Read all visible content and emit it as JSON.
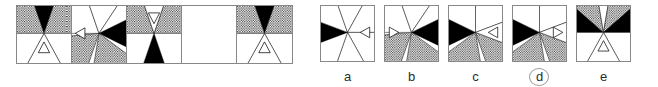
{
  "puzzle": {
    "type": "visual-analogy-matrix",
    "matrix": {
      "name": "matrix-panel",
      "cells": [
        {
          "index": 1,
          "empty": false,
          "description": "radial wedge figure: black wedge at top, dotted wedges upper-left and upper-right, white lower half with small upward triangle outline",
          "wedges": [
            {
              "start": -110,
              "end": -70,
              "fill": "black"
            },
            {
              "start": -180,
              "end": -110,
              "fill": "dotted"
            },
            {
              "start": -70,
              "end": 0,
              "fill": "dotted"
            },
            {
              "start": 0,
              "end": 60,
              "fill": "white"
            },
            {
              "start": 60,
              "end": 120,
              "fill": "white"
            },
            {
              "start": 120,
              "end": 180,
              "fill": "white"
            }
          ],
          "marker": {
            "shape": "triangle-outline",
            "direction": "up",
            "cx": 50,
            "cy": 74
          }
        },
        {
          "index": 2,
          "empty": false,
          "description": "radial wedge figure: black wedge at right, dotted wedges at lower-left and lower-right, small triangle outline pointing left at the left",
          "wedges": [
            {
              "start": -25,
              "end": 25,
              "fill": "black"
            },
            {
              "start": 35,
              "end": 100,
              "fill": "dotted"
            },
            {
              "start": 110,
              "end": 175,
              "fill": "dotted"
            },
            {
              "start": -180,
              "end": -110,
              "fill": "white"
            },
            {
              "start": -110,
              "end": -55,
              "fill": "white"
            },
            {
              "start": -55,
              "end": -25,
              "fill": "white"
            }
          ],
          "marker": {
            "shape": "triangle-outline",
            "direction": "left",
            "cx": 16,
            "cy": 48
          }
        },
        {
          "index": 3,
          "empty": false,
          "description": "radial wedge figure: black wedge at bottom, dotted wedges upper-left and upper-right, small triangle outline pointing down at the top",
          "wedges": [
            {
              "start": 70,
              "end": 110,
              "fill": "black"
            },
            {
              "start": -180,
              "end": -110,
              "fill": "dotted"
            },
            {
              "start": -70,
              "end": 0,
              "fill": "dotted"
            },
            {
              "start": -110,
              "end": -70,
              "fill": "white"
            },
            {
              "start": 0,
              "end": 70,
              "fill": "white"
            },
            {
              "start": 110,
              "end": 180,
              "fill": "white"
            }
          ],
          "marker": {
            "shape": "triangle-outline",
            "direction": "down",
            "cx": 50,
            "cy": 20
          }
        },
        {
          "index": 4,
          "empty": true,
          "description": "blank answer cell",
          "wedges": [],
          "marker": null
        },
        {
          "index": 5,
          "empty": false,
          "description": "radial wedge figure: black wedge at top, dotted wedges upper-left and upper-right, white lower half with small upward triangle outline",
          "wedges": [
            {
              "start": -110,
              "end": -70,
              "fill": "black"
            },
            {
              "start": -180,
              "end": -110,
              "fill": "dotted"
            },
            {
              "start": -70,
              "end": 0,
              "fill": "dotted"
            },
            {
              "start": 0,
              "end": 60,
              "fill": "white"
            },
            {
              "start": 60,
              "end": 120,
              "fill": "white"
            },
            {
              "start": 120,
              "end": 180,
              "fill": "white"
            }
          ],
          "marker": {
            "shape": "triangle-outline",
            "direction": "up",
            "cx": 50,
            "cy": 74
          }
        }
      ]
    },
    "options": [
      {
        "label": "a",
        "selected": false,
        "description": "black wedge at left, all other wedges white, small triangle outline pointing left at the right",
        "wedges": [
          {
            "start": 160,
            "end": -160,
            "fill": "black"
          },
          {
            "start": -160,
            "end": -110,
            "fill": "white"
          },
          {
            "start": -110,
            "end": -60,
            "fill": "white"
          },
          {
            "start": -60,
            "end": 0,
            "fill": "white"
          },
          {
            "start": 0,
            "end": 60,
            "fill": "white"
          },
          {
            "start": 60,
            "end": 110,
            "fill": "white"
          },
          {
            "start": 110,
            "end": 160,
            "fill": "white"
          }
        ],
        "marker": {
          "shape": "triangle-outline",
          "direction": "left",
          "cx": 84,
          "cy": 48
        }
      },
      {
        "label": "b",
        "selected": false,
        "description": "black wedge at right, dotted wedges at lower-left and lower-right, small triangle outline pointing right at the left",
        "wedges": [
          {
            "start": -25,
            "end": 25,
            "fill": "black"
          },
          {
            "start": 35,
            "end": 100,
            "fill": "dotted"
          },
          {
            "start": 110,
            "end": 175,
            "fill": "dotted"
          },
          {
            "start": -180,
            "end": -110,
            "fill": "white"
          },
          {
            "start": -110,
            "end": -55,
            "fill": "white"
          },
          {
            "start": -55,
            "end": -25,
            "fill": "white"
          }
        ],
        "marker": {
          "shape": "triangle-outline",
          "direction": "right",
          "cx": 16,
          "cy": 48
        }
      },
      {
        "label": "c",
        "selected": false,
        "description": "black wedge at left, dotted wedges at lower-left and lower-right, small triangle outline pointing left at the right",
        "wedges": [
          {
            "start": 155,
            "end": -155,
            "fill": "black"
          },
          {
            "start": 80,
            "end": 145,
            "fill": "dotted"
          },
          {
            "start": 20,
            "end": 70,
            "fill": "dotted"
          },
          {
            "start": -155,
            "end": -90,
            "fill": "white"
          },
          {
            "start": -90,
            "end": -20,
            "fill": "white"
          },
          {
            "start": -20,
            "end": 20,
            "fill": "white"
          }
        ],
        "marker": {
          "shape": "triangle-outline",
          "direction": "left",
          "cx": 84,
          "cy": 48
        }
      },
      {
        "label": "d",
        "selected": true,
        "description": "black wedge at left, dotted wedges at lower-left and lower-right, small triangle outline pointing right at the right",
        "wedges": [
          {
            "start": 155,
            "end": -155,
            "fill": "black"
          },
          {
            "start": 80,
            "end": 145,
            "fill": "dotted"
          },
          {
            "start": 20,
            "end": 70,
            "fill": "dotted"
          },
          {
            "start": -155,
            "end": -90,
            "fill": "white"
          },
          {
            "start": -90,
            "end": -20,
            "fill": "white"
          },
          {
            "start": -20,
            "end": 20,
            "fill": "white"
          }
        ],
        "marker": {
          "shape": "triangle-outline",
          "direction": "right",
          "cx": 84,
          "cy": 48
        }
      },
      {
        "label": "e",
        "selected": false,
        "description": "dotted wedges at upper-left and upper-right, black wedges at left and right, small triangle outline pointing up at the bottom",
        "wedges": [
          {
            "start": -180,
            "end": -140,
            "fill": "black"
          },
          {
            "start": -140,
            "end": -100,
            "fill": "dotted"
          },
          {
            "start": -100,
            "end": -80,
            "fill": "white"
          },
          {
            "start": -80,
            "end": -40,
            "fill": "dotted"
          },
          {
            "start": -40,
            "end": 0,
            "fill": "black"
          },
          {
            "start": 0,
            "end": 60,
            "fill": "white"
          },
          {
            "start": 60,
            "end": 120,
            "fill": "white"
          },
          {
            "start": 120,
            "end": 180,
            "fill": "white"
          }
        ],
        "marker": {
          "shape": "triangle-outline",
          "direction": "up",
          "cx": 50,
          "cy": 74
        }
      }
    ],
    "colors": {
      "fill_black": "#000000",
      "fill_white": "#ffffff",
      "stroke": "#000000",
      "border": "#888888",
      "label_text": "#2b2b2b",
      "selection_ring": "#9a9a9a"
    }
  }
}
